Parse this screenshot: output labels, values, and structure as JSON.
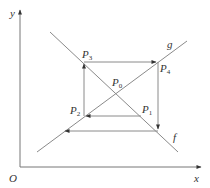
{
  "diagram": {
    "type": "cobweb-diagram",
    "axes": {
      "x_label": "x",
      "y_label": "y",
      "origin_label": "O"
    },
    "curves": [
      {
        "name": "f",
        "label": "f",
        "direction": "decreasing"
      },
      {
        "name": "g",
        "label": "g",
        "direction": "increasing"
      }
    ],
    "points": [
      {
        "name": "P0",
        "base": "P",
        "sub": "0"
      },
      {
        "name": "P1",
        "base": "P",
        "sub": "1"
      },
      {
        "name": "P2",
        "base": "P",
        "sub": "2"
      },
      {
        "name": "P3",
        "base": "P",
        "sub": "3"
      },
      {
        "name": "P4",
        "base": "P",
        "sub": "4"
      }
    ],
    "path_order": [
      "P1",
      "P2",
      "P3",
      "P4",
      "next"
    ],
    "colors": {
      "lines": "#8a8a8a",
      "axes": "#777777",
      "text": "#333333"
    }
  }
}
